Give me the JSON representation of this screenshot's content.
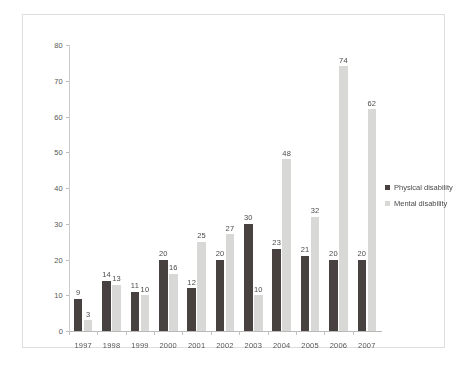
{
  "chart_data": {
    "type": "bar",
    "title": "",
    "subtitle": "",
    "xlabel": "",
    "ylabel": "",
    "ylim": [
      0,
      80
    ],
    "ytick_step": 10,
    "yticks": [
      0,
      10,
      20,
      30,
      40,
      50,
      60,
      70,
      80
    ],
    "grid": false,
    "legend_position": "right",
    "categories": [
      "1997",
      "1998",
      "1999",
      "2000",
      "2001",
      "2002",
      "2003",
      "2004",
      "2005",
      "2006",
      "2007"
    ],
    "series": [
      {
        "name": "Physical disability",
        "color": "#3a3432",
        "values": [
          9,
          14,
          11,
          20,
          12,
          20,
          30,
          23,
          21,
          20,
          20
        ]
      },
      {
        "name": "Mental disability",
        "color": "#d5d5d3",
        "values": [
          3,
          13,
          10,
          16,
          25,
          27,
          10,
          48,
          32,
          74,
          62
        ]
      }
    ],
    "data_labels": true,
    "annotations": []
  },
  "legend": {
    "items": [
      {
        "label": "Physical disability",
        "marker": "square-marker-dark"
      },
      {
        "label": "Mental disability",
        "marker": "square-marker-light"
      }
    ]
  }
}
